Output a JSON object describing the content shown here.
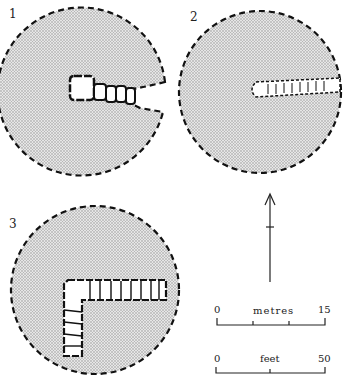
{
  "figure": {
    "panels": [
      {
        "label": "1",
        "description": "circular enclosure with entrance gap to the east and rectangular structure with attached cells"
      },
      {
        "label": "2",
        "description": "circular enclosure with narrow linear passage structure extending to the east edge"
      },
      {
        "label": "3",
        "description": "circular enclosure with L-shaped row of cells"
      }
    ],
    "north_arrow": {
      "label": "north-arrow"
    },
    "scales": [
      {
        "start": "0",
        "unit": "metres",
        "end": "15"
      },
      {
        "start": "0",
        "unit": "feet",
        "end": "50"
      }
    ],
    "colors": {
      "fill": "#d0d0d0",
      "stroke": "#111111"
    }
  }
}
